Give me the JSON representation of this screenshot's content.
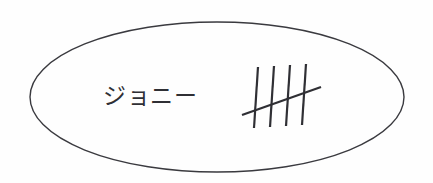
{
  "canvas": {
    "width": 433,
    "height": 183,
    "background_color": "#fefefe"
  },
  "annotation": {
    "type": "hand-drawn-ellipse-label",
    "stroke_color": "#3a3a3f",
    "fill_color": "none",
    "ellipse": {
      "center_x": 217,
      "center_y": 97,
      "radius_x": 187,
      "radius_y": 75,
      "stroke_width": 1.4
    },
    "label": {
      "text": "ジョニー",
      "romaji_meaning": "Johnny",
      "x": 103,
      "y": 104,
      "font_size": 23,
      "color": "#2f2f34"
    },
    "tally": {
      "count_label": "5",
      "stroke_color": "#2f2f34",
      "stroke_width": 2.2,
      "vertical_marks": [
        {
          "x1": 258,
          "y1": 67,
          "x2": 254,
          "y2": 128
        },
        {
          "x1": 274,
          "y1": 66,
          "x2": 270,
          "y2": 127
        },
        {
          "x1": 290,
          "y1": 65,
          "x2": 286,
          "y2": 126
        },
        {
          "x1": 306,
          "y1": 64,
          "x2": 302,
          "y2": 125
        }
      ],
      "diagonal_mark": {
        "x1": 242,
        "y1": 115,
        "x2": 321,
        "y2": 87
      }
    }
  }
}
